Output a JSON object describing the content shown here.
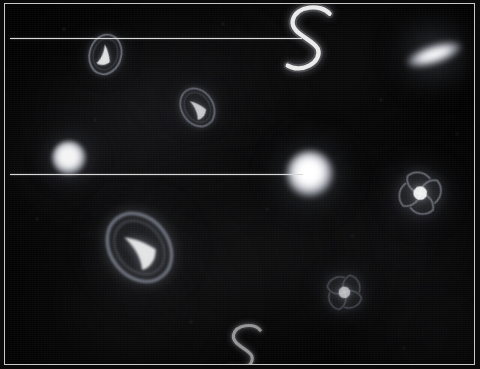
{
  "scene": {
    "title": "Galaxy Field",
    "background_color": "#020202",
    "frame_color": "#c9c9c9",
    "nebula_color": "#2a2a2e",
    "ruler_color": "#d8d8d8",
    "width": 480,
    "height": 369
  },
  "rulers": [
    {
      "name": "upper-measure-line",
      "x": 5,
      "y": 34,
      "length": 292
    },
    {
      "name": "lower-measure-line",
      "x": 5,
      "y": 170,
      "length": 293
    }
  ],
  "nebulae": [
    {
      "x": 150,
      "y": 110,
      "w": 230,
      "h": 150,
      "color": "#26262b",
      "blur": 46,
      "opacity": 0.95
    },
    {
      "x": 330,
      "y": 60,
      "w": 180,
      "h": 130,
      "color": "#1e1e22",
      "blur": 44,
      "opacity": 0.8
    },
    {
      "x": 60,
      "y": 160,
      "w": 150,
      "h": 120,
      "color": "#202024",
      "blur": 40,
      "opacity": 0.75
    },
    {
      "x": 250,
      "y": 250,
      "w": 260,
      "h": 150,
      "color": "#232327",
      "blur": 50,
      "opacity": 0.85
    },
    {
      "x": 400,
      "y": 230,
      "w": 170,
      "h": 160,
      "color": "#1c1c20",
      "blur": 44,
      "opacity": 0.75
    },
    {
      "x": 120,
      "y": 300,
      "w": 200,
      "h": 120,
      "color": "#242428",
      "blur": 46,
      "opacity": 0.8
    },
    {
      "x": 430,
      "y": 330,
      "w": 130,
      "h": 110,
      "color": "#1b1b1f",
      "blur": 38,
      "opacity": 0.7
    },
    {
      "x": 210,
      "y": 60,
      "w": 150,
      "h": 90,
      "color": "#141417",
      "blur": 36,
      "opacity": 0.6
    }
  ],
  "galaxies": [
    {
      "name": "galaxy-spiral-upper-left",
      "kind": "spiral-s-core",
      "x": 100,
      "y": 50,
      "size": 24,
      "rotation": 15,
      "brightness": 0.85,
      "core_color": "#ffffff",
      "halo_color": "#9aa0b0"
    },
    {
      "name": "galaxy-s-shape-upper-right",
      "kind": "s-curve",
      "x": 303,
      "y": 35,
      "size": 44,
      "rotation": 0,
      "brightness": 1.0,
      "core_color": "#f2f2f2",
      "halo_color": "#bfbfbf"
    },
    {
      "name": "galaxy-edge-on-right",
      "kind": "edge-on",
      "x": 429,
      "y": 50,
      "size": 30,
      "rotation": -18,
      "brightness": 1.0,
      "core_color": "#ffffff",
      "halo_color": "#c8c8d0"
    },
    {
      "name": "galaxy-ring-upper-middle",
      "kind": "ring-lens",
      "x": 192,
      "y": 103,
      "size": 24,
      "rotation": -32,
      "brightness": 0.78,
      "core_color": "#f0f0f0",
      "halo_color": "#8f96a6"
    },
    {
      "name": "star-blob-left",
      "kind": "blob",
      "x": 64,
      "y": 154,
      "size": 17,
      "rotation": 0,
      "brightness": 0.95,
      "core_color": "#ffffff",
      "halo_color": "#b9bec9"
    },
    {
      "name": "star-blob-center",
      "kind": "blob",
      "x": 305,
      "y": 170,
      "size": 23,
      "rotation": 0,
      "brightness": 1.0,
      "core_color": "#ffffff",
      "halo_color": "#cfd3dc"
    },
    {
      "name": "galaxy-spiral-right",
      "kind": "spiral-arms",
      "x": 415,
      "y": 189,
      "size": 26,
      "rotation": 25,
      "brightness": 0.92,
      "core_color": "#ffffff",
      "halo_color": "#a9b0bd"
    },
    {
      "name": "galaxy-ring-lower-left",
      "kind": "ring-lens",
      "x": 134,
      "y": 243,
      "size": 44,
      "rotation": -38,
      "brightness": 0.88,
      "core_color": "#ffffff",
      "halo_color": "#99a0b0"
    },
    {
      "name": "galaxy-spiral-lower-middle",
      "kind": "spiral-arms",
      "x": 339,
      "y": 288,
      "size": 22,
      "rotation": -10,
      "brightness": 0.7,
      "core_color": "#e8e8e8",
      "halo_color": "#8a90a0"
    },
    {
      "name": "galaxy-s-shape-bottom",
      "kind": "s-curve",
      "x": 239,
      "y": 344,
      "size": 32,
      "rotation": 0,
      "brightness": 0.62,
      "core_color": "#d8d8d8",
      "halo_color": "#9a9a9a"
    }
  ],
  "faint_stars": [
    {
      "x": 59,
      "y": 25,
      "size": 2,
      "opacity": 0.22
    },
    {
      "x": 218,
      "y": 20,
      "size": 2,
      "opacity": 0.18
    },
    {
      "x": 376,
      "y": 96,
      "size": 2,
      "opacity": 0.2
    },
    {
      "x": 452,
      "y": 130,
      "size": 2,
      "opacity": 0.16
    },
    {
      "x": 32,
      "y": 215,
      "size": 2,
      "opacity": 0.18
    },
    {
      "x": 262,
      "y": 205,
      "size": 2,
      "opacity": 0.15
    },
    {
      "x": 186,
      "y": 318,
      "size": 2,
      "opacity": 0.17
    },
    {
      "x": 399,
      "y": 344,
      "size": 2,
      "opacity": 0.15
    },
    {
      "x": 90,
      "y": 116,
      "size": 2,
      "opacity": 0.14
    },
    {
      "x": 347,
      "y": 232,
      "size": 2,
      "opacity": 0.14
    }
  ]
}
